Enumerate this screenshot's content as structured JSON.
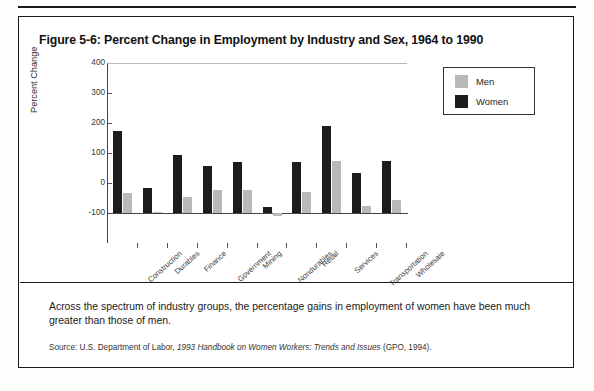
{
  "figure": {
    "title": "Figure 5-6: Percent Change in Employment by Industry and Sex, 1964 to 1990",
    "caption": "Across the spectrum of industry groups, the percentage gains in employment of women have been much greater than those of men.",
    "source_prefix": "Source: U.S. Department of Labor, ",
    "source_italic": "1993 Handbook on Women Workers: Trends and Issues",
    "source_suffix": " (GPO, 1994)."
  },
  "legend": {
    "position": "right",
    "items": [
      {
        "label": "Men",
        "color": "#b9b9b9"
      },
      {
        "label": "Women",
        "color": "#1c1c1c"
      }
    ]
  },
  "chart_data": {
    "type": "bar",
    "title": "Percent Change in Employment by Industry and Sex, 1964 to 1990",
    "xlabel": "",
    "ylabel": "Percent Change",
    "ylim": [
      -100,
      400
    ],
    "yticks": [
      -100,
      0,
      100,
      200,
      300,
      400
    ],
    "grid": false,
    "legend": [
      "Men",
      "Women"
    ],
    "categories": [
      "Construction",
      "Durables",
      "Finance",
      "Government",
      "Mining",
      "Nondurables",
      "Retail",
      "Services",
      "Transportation",
      "Wholesale"
    ],
    "series": [
      {
        "name": "Women",
        "color": "#1c1c1c",
        "values": [
          272,
          85,
          193,
          158,
          170,
          20,
          170,
          290,
          133,
          175
        ]
      },
      {
        "name": "Men",
        "color": "#b9b9b9",
        "values": [
          67,
          5,
          55,
          78,
          78,
          -10,
          70,
          175,
          25,
          45
        ]
      }
    ]
  }
}
